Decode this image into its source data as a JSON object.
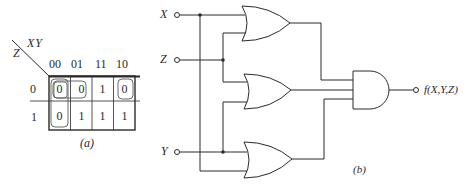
{
  "kmap": {
    "row_var": "Z",
    "col_vars": "XY",
    "col_headers": [
      "00",
      "01",
      "11",
      "10"
    ],
    "row_headers": [
      "0",
      "1"
    ],
    "cells": [
      [
        "0",
        "0",
        "1",
        "0"
      ],
      [
        "0",
        "1",
        "1",
        "1"
      ]
    ],
    "groupings": [
      {
        "cells": [
          [
            0,
            0
          ],
          [
            1,
            0
          ]
        ],
        "description": "Z=0,XY=00 and Z=1,XY=00 (column 00)"
      },
      {
        "cells": [
          [
            0,
            0
          ],
          [
            0,
            1
          ]
        ],
        "description": "Z=0, XY=00 and 01"
      },
      {
        "cells": [
          [
            0,
            0
          ],
          [
            0,
            3
          ]
        ],
        "description": "Z=0, XY=00 and 10 (wrap-around)"
      }
    ],
    "caption": "(a)"
  },
  "circuit": {
    "inputs": [
      {
        "label": "X"
      },
      {
        "label": "Z"
      },
      {
        "label": "Y"
      }
    ],
    "gates": [
      {
        "type": "OR",
        "inputs": [
          "X",
          "Z"
        ]
      },
      {
        "type": "OR",
        "inputs": [
          "Z",
          "Y"
        ]
      },
      {
        "type": "OR",
        "inputs": [
          "Y",
          "X"
        ]
      },
      {
        "type": "AND",
        "inputs": [
          "OR1",
          "OR2",
          "OR3"
        ]
      }
    ],
    "output_label": "f(X,Y,Z)",
    "caption": "(b)"
  },
  "colors": {
    "line": "#2a2a2a",
    "background": "#ffffff"
  }
}
